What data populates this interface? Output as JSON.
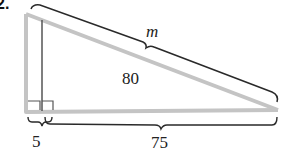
{
  "problem_number": "2.",
  "diagram": {
    "type": "right-triangle-with-altitude",
    "labels": {
      "hypotenuse": "m",
      "altitude_side": "80",
      "small_base_segment": "5",
      "large_base_segment": "75"
    },
    "colors": {
      "triangle_stroke": "#c4c4c4",
      "brace_stroke": "#2a2a2a",
      "text": "#222222"
    }
  }
}
